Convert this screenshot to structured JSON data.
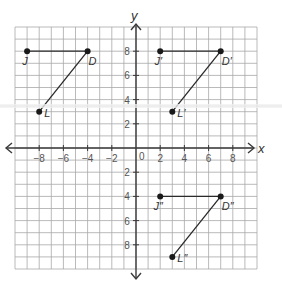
{
  "chart_data": {
    "type": "scatter",
    "title": "",
    "xlabel": "x",
    "ylabel": "y",
    "xlim": [
      -10,
      10
    ],
    "ylim": [
      -10,
      10
    ],
    "grid": true,
    "x_ticks": [
      -8,
      -6,
      -4,
      -2,
      2,
      4,
      6,
      8
    ],
    "y_ticks": [
      8,
      6,
      4,
      2,
      -2,
      -4,
      -6,
      -8
    ],
    "origin_label": "0",
    "tick_labels": {
      "x": [
        "−8",
        "−6",
        "−4",
        "−2",
        "2",
        "4",
        "6",
        "8"
      ],
      "y": [
        "8",
        "6",
        "4",
        "2",
        "2",
        "4",
        "6",
        "8"
      ]
    },
    "series": [
      {
        "name": "Original JDL",
        "points": [
          {
            "label": "J",
            "x": -9,
            "y": 8
          },
          {
            "label": "D",
            "x": -4,
            "y": 8
          },
          {
            "label": "L",
            "x": -8,
            "y": 3
          }
        ],
        "segments": [
          [
            "J",
            "D"
          ],
          [
            "D",
            "L"
          ]
        ]
      },
      {
        "name": "Image J'D'L'",
        "points": [
          {
            "label": "J′",
            "x": 2,
            "y": 8
          },
          {
            "label": "D′",
            "x": 7,
            "y": 8
          },
          {
            "label": "L′",
            "x": 3,
            "y": 3
          }
        ],
        "segments": [
          [
            "J′",
            "D′"
          ],
          [
            "D′",
            "L′"
          ]
        ]
      },
      {
        "name": "Image J''D''L''",
        "points": [
          {
            "label": "J″",
            "x": 2,
            "y": -4
          },
          {
            "label": "D″",
            "x": 7,
            "y": -4
          },
          {
            "label": "L″",
            "x": 3,
            "y": -9
          }
        ],
        "segments": [
          [
            "J″",
            "D″"
          ],
          [
            "D″",
            "L″"
          ]
        ]
      }
    ]
  },
  "colors": {
    "grid": "#a8a8a8",
    "axis": "#3a3a3a",
    "segment": "#2a2a2a",
    "point": "#1a1a1a",
    "text": "#333333",
    "tick_text": "#555555"
  }
}
